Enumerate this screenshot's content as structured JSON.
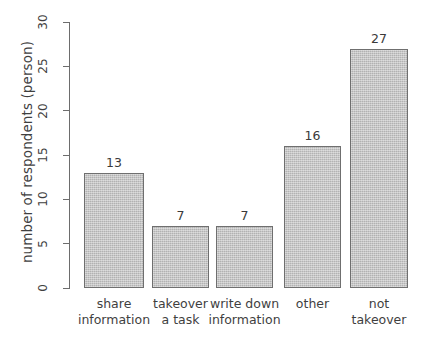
{
  "chart_data": {
    "type": "bar",
    "title": "",
    "xlabel": "",
    "ylabel": "number of respondents (person)",
    "categories": [
      "share information",
      "takeover a task",
      "write down information",
      "other",
      "not takeover"
    ],
    "category_lines": [
      [
        "share",
        "information"
      ],
      [
        "takeover",
        "a task"
      ],
      [
        "write down",
        "information"
      ],
      [
        "other",
        ""
      ],
      [
        "not",
        "takeover"
      ]
    ],
    "values": [
      13,
      7,
      7,
      16,
      27
    ],
    "value_labels": [
      "13",
      "7",
      "7",
      "16",
      "27"
    ],
    "ylim": [
      0,
      30
    ],
    "yticks": [
      0,
      5,
      10,
      15,
      20,
      25,
      30
    ],
    "ytick_labels": [
      "0",
      "5",
      "10",
      "15",
      "20",
      "25",
      "30"
    ],
    "grid": false,
    "legend": null,
    "legend_position": "none",
    "bar_fill_color": "#bfbfbf",
    "bar_border_color": "#6f6f6f",
    "axis_color": "#6d6d6d",
    "text_color": "#3f3f3f",
    "background_color": "#ffffff"
  }
}
